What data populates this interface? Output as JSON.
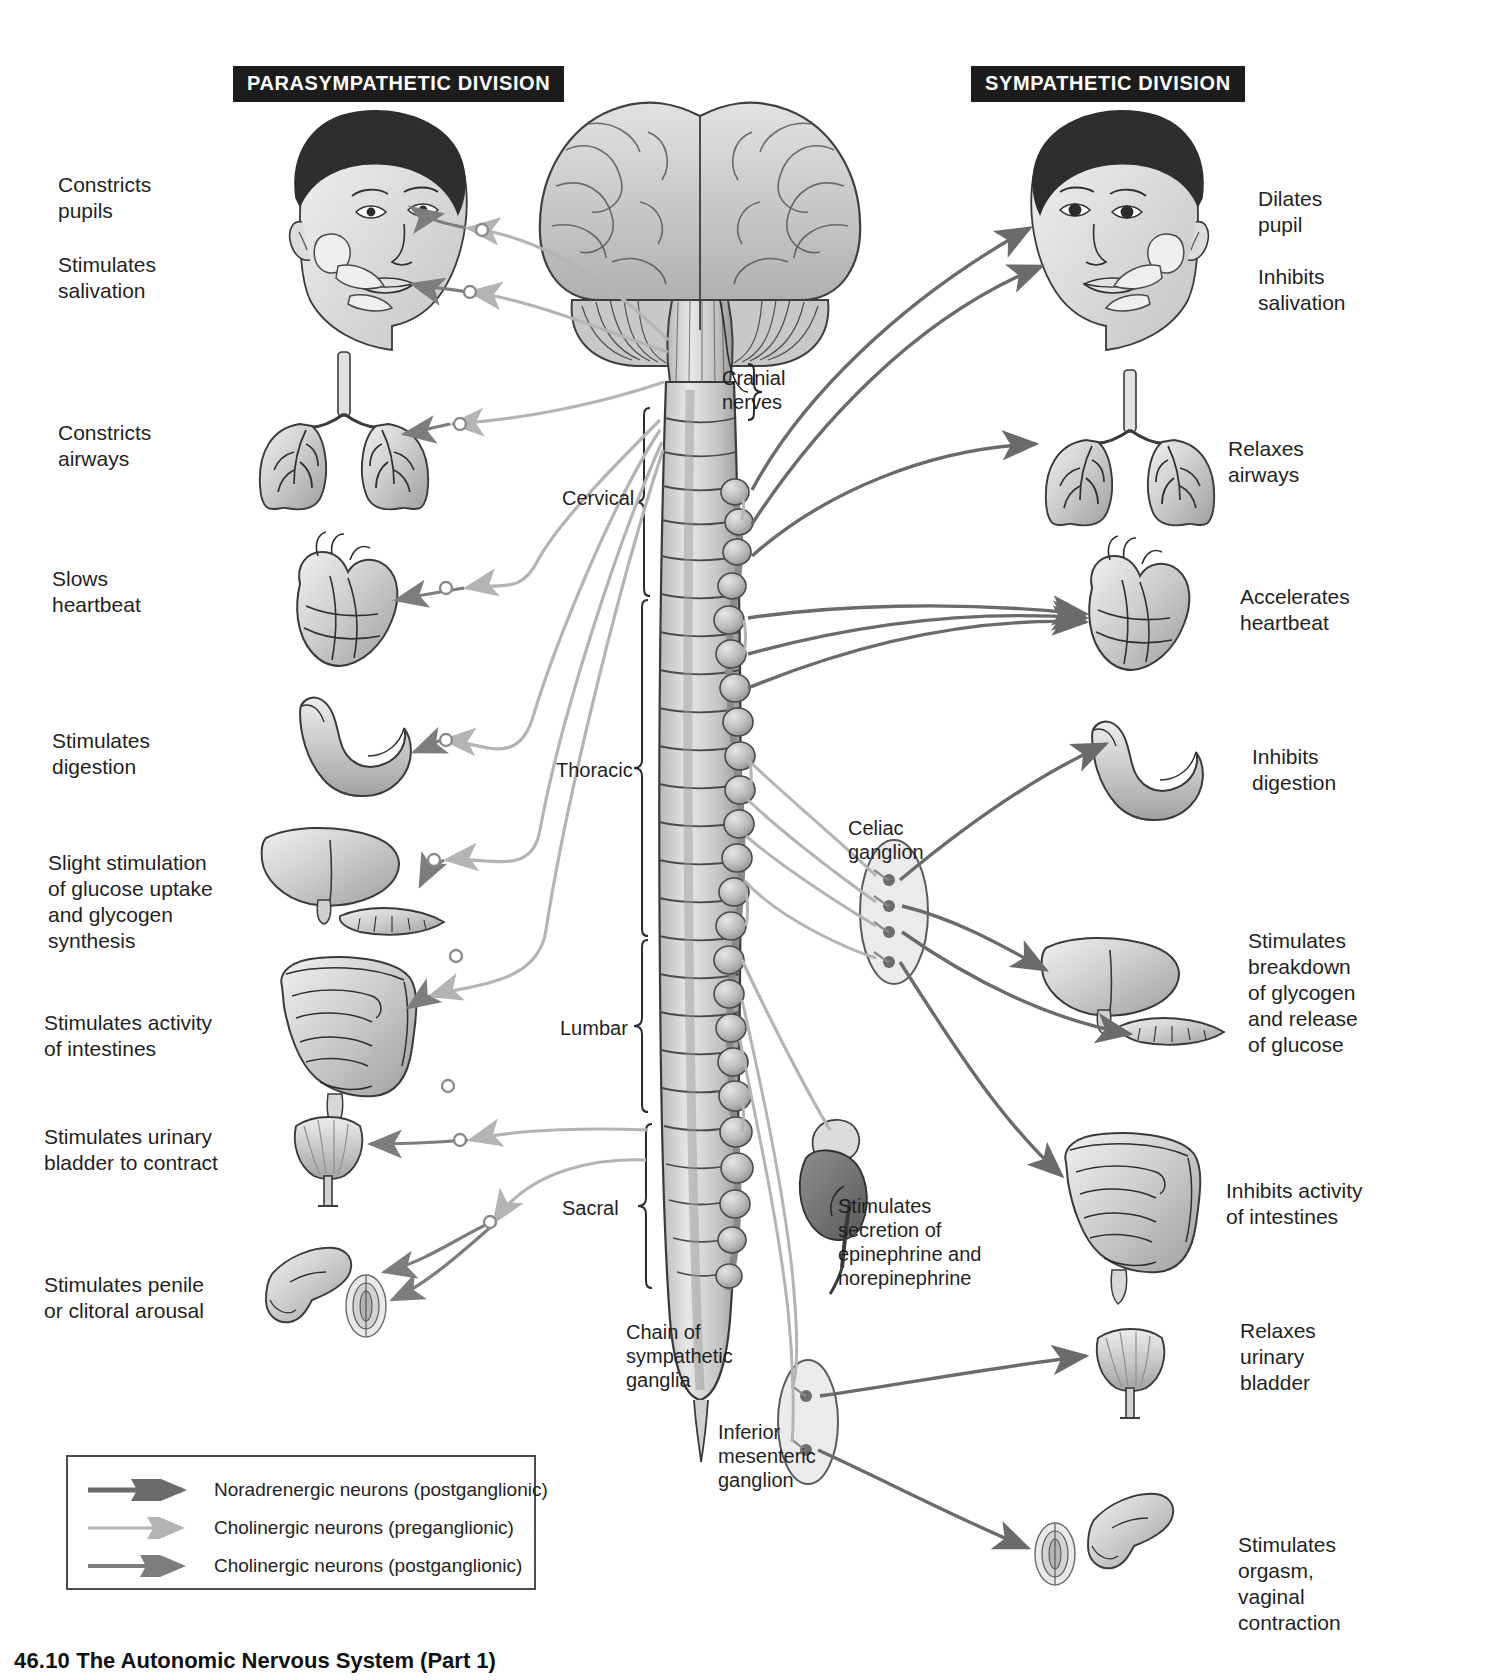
{
  "figure": {
    "caption_number": "46.10",
    "caption_title": "The Autonomic Nervous System (Part 1)"
  },
  "banners": {
    "parasympathetic": "PARASYMPATHETIC DIVISION",
    "sympathetic": "SYMPATHETIC DIVISION"
  },
  "parasympathetic_effects": [
    {
      "id": "pupil",
      "text": "Constricts\npupils"
    },
    {
      "id": "salivation",
      "text": "Stimulates\nsalivation"
    },
    {
      "id": "airways",
      "text": "Constricts\nairways"
    },
    {
      "id": "heart",
      "text": "Slows\nheartbeat"
    },
    {
      "id": "digestion",
      "text": "Stimulates\ndigestion"
    },
    {
      "id": "liver",
      "text": "Slight stimulation\nof glucose uptake\nand glycogen\nsynthesis"
    },
    {
      "id": "intestines",
      "text": "Stimulates activity\nof intestines"
    },
    {
      "id": "bladder",
      "text": "Stimulates urinary\nbladder to contract"
    },
    {
      "id": "genitals",
      "text": "Stimulates penile\nor clitoral arousal"
    }
  ],
  "sympathetic_effects": [
    {
      "id": "pupil",
      "text": "Dilates\npupil"
    },
    {
      "id": "salivation",
      "text": "Inhibits\nsalivation"
    },
    {
      "id": "airways",
      "text": "Relaxes\nairways"
    },
    {
      "id": "heart",
      "text": "Accelerates\nheartbeat"
    },
    {
      "id": "digestion",
      "text": "Inhibits\ndigestion"
    },
    {
      "id": "liver",
      "text": "Stimulates\nbreakdown\nof glycogen\nand release\nof glucose"
    },
    {
      "id": "intestines",
      "text": "Inhibits activity\nof intestines"
    },
    {
      "id": "bladder",
      "text": "Relaxes\nurinary\nbladder"
    },
    {
      "id": "genitals",
      "text": "Stimulates\norgasm,\nvaginal\ncontraction"
    }
  ],
  "anatomy_callouts": {
    "cranial_nerves": "Cranial\nnerves",
    "celiac_ganglion": "Celiac\nganglion",
    "adrenal": "Stimulates\nsecretion of\nepinephrine and\nnorepinephrine",
    "chain": "Chain of\nsympathetic\nganglia",
    "inferior_mesenteric": "Inferior\nmesenteric\nganglion"
  },
  "spinal_regions": [
    {
      "id": "cervical",
      "label": "Cervical"
    },
    {
      "id": "thoracic",
      "label": "Thoracic"
    },
    {
      "id": "lumbar",
      "label": "Lumbar"
    },
    {
      "id": "sacral",
      "label": "Sacral"
    }
  ],
  "legend": [
    {
      "id": "noradrenergic-post",
      "label": "Noradrenergic neurons (postganglionic)",
      "color": "#6b6b6b",
      "weight": "thick"
    },
    {
      "id": "cholinergic-pre",
      "label": "Cholinergic neurons (preganglionic)",
      "color": "#b4b4b4",
      "weight": "thin"
    },
    {
      "id": "cholinergic-post",
      "label": "Cholinergic neurons (postganglionic)",
      "color": "#7d7d7d",
      "weight": "medium"
    }
  ],
  "colors": {
    "banner_bg": "#1c1c1c",
    "banner_text": "#ffffff",
    "text": "#1f1f1f",
    "nerve_dark": "#6b6b6b",
    "nerve_light": "#b4b4b4",
    "nerve_mid": "#7d7d7d",
    "organ_fill": "#d5d5d5",
    "organ_stroke": "#3a3a3a",
    "hair": "#2e2e2e"
  }
}
